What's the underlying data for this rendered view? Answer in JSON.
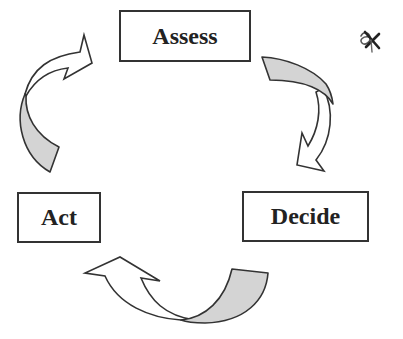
{
  "diagram": {
    "type": "cycle",
    "nodes": [
      {
        "id": "assess",
        "label": "Assess"
      },
      {
        "id": "decide",
        "label": "Decide"
      },
      {
        "id": "act",
        "label": "Act"
      }
    ],
    "edges": [
      {
        "from": "assess",
        "to": "decide",
        "style": "curved-block-arrow"
      },
      {
        "from": "decide",
        "to": "act",
        "style": "curved-block-arrow"
      },
      {
        "from": "act",
        "to": "assess",
        "style": "curved-block-arrow"
      }
    ],
    "colors": {
      "outline": "#333333",
      "arrow_tail_fill": "#d4d4d4",
      "arrow_head_fill": "#ffffff",
      "text": "#222222",
      "background": "#ffffff"
    },
    "annotation_icon": "handwritten-scribble-mark"
  }
}
